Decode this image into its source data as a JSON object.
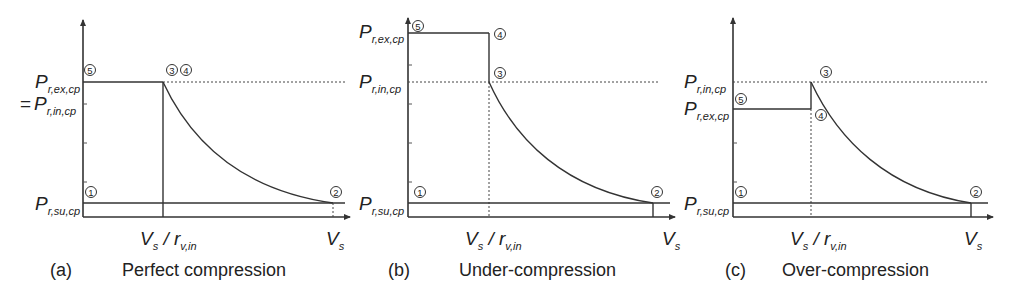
{
  "figure": {
    "panels": [
      {
        "id": "a",
        "tag": "(a)",
        "title": "Perfect compression",
        "y_labels": [
          {
            "main": "P",
            "sub": "r,ex,cp",
            "prefix": ""
          },
          {
            "main": "P",
            "sub": "r,in,cp",
            "prefix": "="
          },
          {
            "main": "P",
            "sub": "r,su,cp",
            "prefix": ""
          }
        ],
        "x_labels": [
          {
            "main": "V",
            "sub": "s",
            "rest": " / r",
            "rest_sub": "v,in"
          },
          {
            "main": "V",
            "sub": "s"
          }
        ],
        "points": [
          "1",
          "2",
          "3",
          "4",
          "5"
        ],
        "point_labels": {
          "p1": "1",
          "p2": "2",
          "p34": "3 4",
          "p5": "5"
        }
      },
      {
        "id": "b",
        "tag": "(b)",
        "title": "Under-compression",
        "y_labels": [
          {
            "main": "P",
            "sub": "r,ex,cp"
          },
          {
            "main": "P",
            "sub": "r,in,cp"
          },
          {
            "main": "P",
            "sub": "r,su,cp"
          }
        ],
        "x_labels": [
          {
            "main": "V",
            "sub": "s",
            "rest": " / r",
            "rest_sub": "v,in"
          },
          {
            "main": "V",
            "sub": "s"
          }
        ],
        "point_labels": {
          "p1": "1",
          "p2": "2",
          "p3": "3",
          "p4": "4",
          "p5": "5"
        }
      },
      {
        "id": "c",
        "tag": "(c)",
        "title": "Over-compression",
        "y_labels": [
          {
            "main": "P",
            "sub": "r,in,cp"
          },
          {
            "main": "P",
            "sub": "r,ex,cp"
          },
          {
            "main": "P",
            "sub": "r,su,cp"
          }
        ],
        "x_labels": [
          {
            "main": "V",
            "sub": "s",
            "rest": " / r",
            "rest_sub": "v,in"
          },
          {
            "main": "V",
            "sub": "s"
          }
        ],
        "point_labels": {
          "p1": "1",
          "p2": "2",
          "p3": "3",
          "p4": "4",
          "p5": "5"
        }
      }
    ]
  },
  "labels": {
    "P": "P",
    "V": "V",
    "eq": "=",
    "slash_r": " / r",
    "sub_ex": "r,ex,cp",
    "sub_in": "r,in,cp",
    "sub_su": "r,su,cp",
    "sub_s": "s",
    "sub_vin": "v,in",
    "n1": "1",
    "n2": "2",
    "n3": "3",
    "n4": "4",
    "n5": "5",
    "a_tag": "(a)",
    "a_title": "Perfect compression",
    "b_tag": "(b)",
    "b_title": "Under-compression",
    "c_tag": "(c)",
    "c_title": "Over-compression"
  }
}
